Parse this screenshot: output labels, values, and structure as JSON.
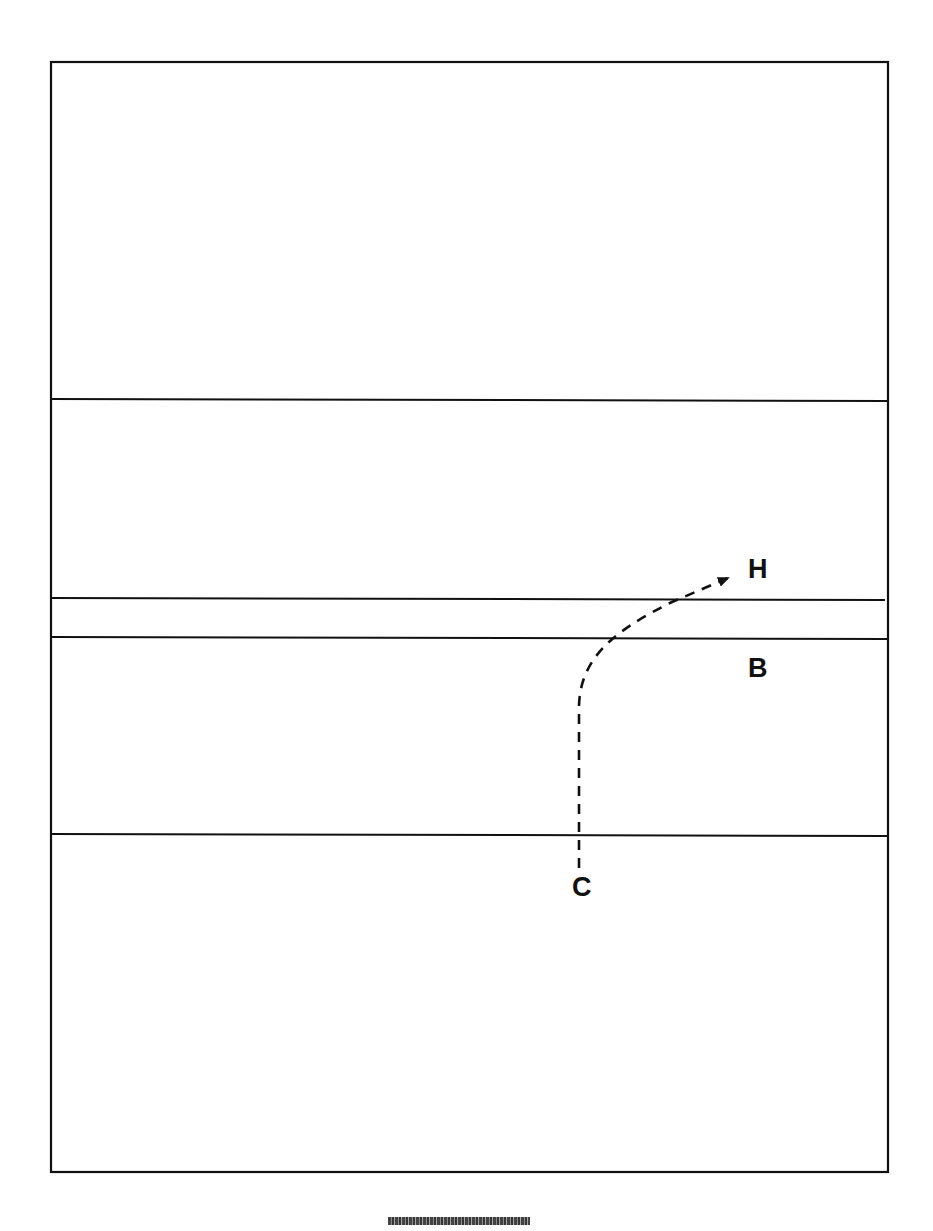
{
  "diagram": {
    "frame": {
      "x1": 51,
      "y1": 62,
      "x2": 888,
      "y2": 1172,
      "stroke": "#111111"
    },
    "horizontal_lines": [
      {
        "y_left": 399,
        "y_right": 401
      },
      {
        "y_left": 598,
        "y_right": 600
      },
      {
        "y_left": 637,
        "y_right": 639
      },
      {
        "y_left": 834,
        "y_right": 836
      }
    ],
    "path": {
      "style": "dashed",
      "start": [
        579,
        868
      ],
      "end": [
        730,
        577
      ],
      "arrowhead": "end"
    },
    "labels": {
      "h": "H",
      "b": "B",
      "c": "C"
    }
  },
  "footer": {
    "code_text": "illegible scrambled code"
  }
}
